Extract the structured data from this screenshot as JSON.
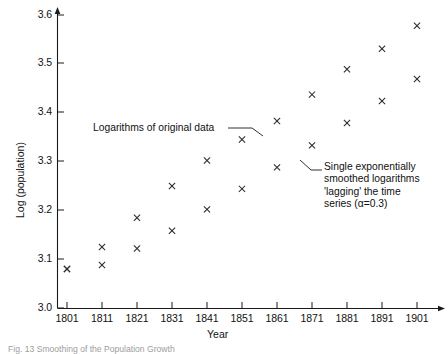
{
  "figure": {
    "caption": "Fig. 13 Smoothing of the Population Growth",
    "background": "#ffffff",
    "marker_color": "#2b2b2b"
  },
  "axes": {
    "xlabel": "Year",
    "ylabel": "Log (population)",
    "yticks": [
      "3.0",
      "3.1",
      "3.2",
      "3.3",
      "3.4",
      "3.5",
      "3.6"
    ],
    "xticks": [
      "1801",
      "1811",
      "1821",
      "1831",
      "1841",
      "1851",
      "1861",
      "1871",
      "1881",
      "1891",
      "1901"
    ]
  },
  "annotations": {
    "original": "Logarithms of original data",
    "smoothed_line1": "Single exponentially",
    "smoothed_line2": "smoothed logarithms",
    "smoothed_line3": "'lagging' the time",
    "smoothed_line4": "series (α=0.3)"
  },
  "chart_data": {
    "type": "scatter",
    "title": "",
    "xlabel": "Year",
    "ylabel": "Log (population)",
    "xlim": [
      1801,
      1906
    ],
    "ylim": [
      3.0,
      3.62
    ],
    "grid": false,
    "legend": "annotations",
    "x": [
      1801,
      1811,
      1821,
      1831,
      1841,
      1851,
      1861,
      1871,
      1881,
      1891,
      1901
    ],
    "series": [
      {
        "name": "Logarithms of original data",
        "marker": "x",
        "values": [
          3.08,
          3.125,
          3.185,
          3.25,
          3.302,
          3.345,
          3.383,
          3.437,
          3.489,
          3.531,
          3.578
        ]
      },
      {
        "name": "Single exponentially smoothed logarithms ('lagging' the time series, alpha=0.3)",
        "marker": "x",
        "values": [
          3.08,
          3.088,
          3.122,
          3.158,
          3.202,
          3.244,
          3.288,
          3.333,
          3.379,
          3.424,
          3.469
        ]
      }
    ]
  }
}
